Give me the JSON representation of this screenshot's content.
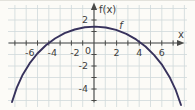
{
  "chart_data": {
    "type": "line",
    "title": "",
    "xlabel": "x",
    "ylabel": "f(x)",
    "curve_label": "f",
    "grid": true,
    "xlim": [
      -7.7,
      8.2
    ],
    "ylim": [
      -5.8,
      3.4
    ],
    "x_tick_labels": [
      -6,
      -4,
      -2,
      0,
      2,
      4,
      6
    ],
    "y_tick_labels": [
      2,
      -2,
      -4
    ],
    "origin_label": "0",
    "x_tick_range": [
      -7,
      7
    ],
    "y_tick_range": [
      -5,
      2
    ],
    "x_grid_range": [
      -7,
      8
    ],
    "y_grid_range": [
      -5,
      3
    ],
    "vertex_approx": [
      0.1,
      1.4
    ],
    "roots_approx": [
      -4.2,
      4.3
    ],
    "series": [
      {
        "name": "f",
        "points": [
          [
            -7.26,
            -5.13
          ],
          [
            -6.83,
            -3.88
          ],
          [
            -6.31,
            -2.76
          ],
          [
            -5.7,
            -1.77
          ],
          [
            -5.01,
            -0.91
          ],
          [
            -4.26,
            -0.19
          ],
          [
            -3.45,
            0.39
          ],
          [
            -2.6,
            0.85
          ],
          [
            -1.71,
            1.17
          ],
          [
            -0.81,
            1.37
          ],
          [
            0.12,
            1.43
          ],
          [
            1.04,
            1.35
          ],
          [
            1.96,
            1.14
          ],
          [
            2.86,
            0.79
          ],
          [
            3.73,
            0.31
          ],
          [
            4.56,
            -0.3
          ],
          [
            5.33,
            -1.05
          ],
          [
            6.04,
            -1.93
          ],
          [
            6.68,
            -2.95
          ],
          [
            7.24,
            -4.1
          ],
          [
            7.7,
            -5.39
          ]
        ]
      }
    ],
    "colors": {
      "curve": "#37325c",
      "grid": "#cfd9da",
      "axis": "#4a4a48",
      "text": "#3e3e3c",
      "background": "#fcfbf7"
    }
  }
}
